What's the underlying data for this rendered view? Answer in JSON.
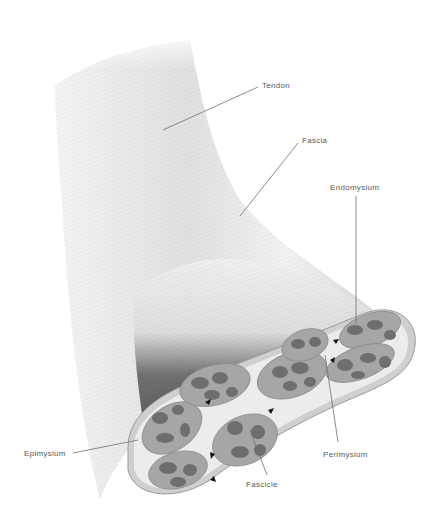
{
  "diagram": {
    "labels": {
      "tendon": "Tendon",
      "fascia": "Fascia",
      "endomysium": "Endomysium",
      "epimysium": "Epimysium",
      "perimysium": "Perimysium",
      "fascicle": "Fascicle"
    },
    "colors": {
      "background": "#ffffff",
      "tendon": "#e6e6e6",
      "muscle_dark": "#4a4a4a",
      "sheath": "#e8e8e8",
      "fascicle_fill": "#a9a9a9",
      "fiber_fill": "#6f6f6f",
      "leader_line": "#707070",
      "label_text": "#5a5a5a"
    }
  }
}
